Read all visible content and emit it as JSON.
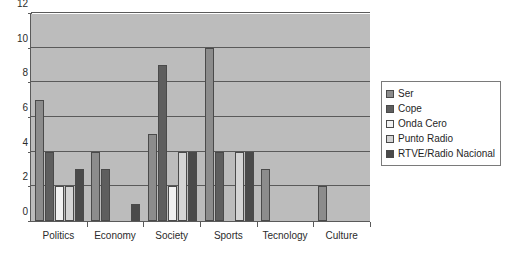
{
  "chart_data": {
    "type": "bar",
    "title": "",
    "xlabel": "",
    "ylabel": "",
    "categories": [
      "Politics",
      "Economy",
      "Society",
      "Sports",
      "Tecnology",
      "Culture"
    ],
    "series": [
      {
        "name": "Ser",
        "color": "#8c8c8c",
        "values": [
          7,
          4,
          5,
          10,
          3,
          2
        ]
      },
      {
        "name": "Cope",
        "color": "#5e5e5e",
        "values": [
          4,
          3,
          9,
          4,
          0,
          0
        ]
      },
      {
        "name": "Onda Cero",
        "color": "#f2f2f2",
        "values": [
          2,
          0,
          2,
          0,
          0,
          0
        ]
      },
      {
        "name": "Punto Radio",
        "color": "#d4d4d4",
        "values": [
          2,
          0,
          4,
          4,
          0,
          0
        ]
      },
      {
        "name": "RTVE/Radio Nacional",
        "color": "#4a4a4a",
        "values": [
          3,
          1,
          4,
          4,
          0,
          0
        ]
      }
    ],
    "ylim": [
      0,
      12
    ],
    "yticks": [
      0,
      2,
      4,
      6,
      8,
      10,
      12
    ],
    "ytick_labels": [
      "0",
      "2",
      "4",
      "6",
      "8",
      "10",
      "12"
    ],
    "grid": true,
    "legend_position": "right",
    "plot_background": "#bcbcbc",
    "axis_color": "#5a5a5a"
  }
}
